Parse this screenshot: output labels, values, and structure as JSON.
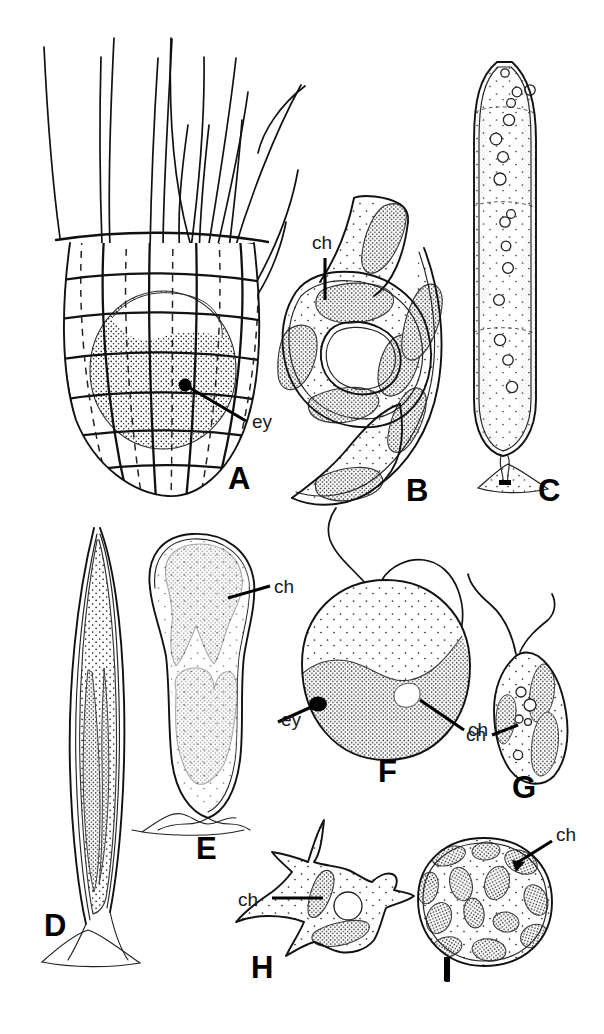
{
  "figure": {
    "background_color": "#ffffff",
    "ink_color": "#111111",
    "width": 604,
    "height": 1034,
    "panel_count": 9
  },
  "legend_keys": [
    {
      "abbr": "ch",
      "meaning": "chloroplast"
    },
    {
      "abbr": "ey",
      "meaning": "eyespot"
    }
  ],
  "panels": [
    {
      "id": "A",
      "letter": "A",
      "letter_x": 228,
      "letter_y": 489,
      "description": "Loricate flagellate with latticed gridded lorica, dashed internal ribs, dense stippled protoplast and a tuft of long bristles",
      "labels": [
        {
          "abbr": "ey",
          "text": "ey",
          "x": 252,
          "y": 428
        }
      ]
    },
    {
      "id": "B",
      "letter": "B",
      "letter_x": 406,
      "letter_y": 501,
      "description": "Spirally coiled ribbon-shaped cell with discoid chloroplasts and fine stippling",
      "labels": [
        {
          "abbr": "ch",
          "text": "ch",
          "x": 318,
          "y": 249
        }
      ]
    },
    {
      "id": "C",
      "letter": "C",
      "letter_x": 538,
      "letter_y": 501,
      "description": "Elongate club-shaped stalked cell attached to substrate, with parietal chloroplasts and a row of round vacuoles",
      "labels": []
    },
    {
      "id": "D",
      "letter": "D",
      "letter_x": 44,
      "letter_y": 936,
      "description": "Very elongate fusiform stalked cell with two lateral band chloroplasts and stippled cytoplasm",
      "labels": []
    },
    {
      "id": "E",
      "letter": "E",
      "letter_x": 196,
      "letter_y": 859,
      "description": "Club-shaped stalked cell with two lobed stippled chloroplasts",
      "labels": [
        {
          "abbr": "ch",
          "text": "ch",
          "x": 274,
          "y": 593
        }
      ]
    },
    {
      "id": "F",
      "letter": "F",
      "letter_x": 378,
      "letter_y": 782,
      "description": "Large spherical biflagellate cell with a single curved parietal chloroplast and a prominent eyespot",
      "labels": [
        {
          "abbr": "ey",
          "text": "ey",
          "x": 281,
          "y": 726
        },
        {
          "abbr": "ch",
          "text": "ch",
          "x": 475,
          "y": 736
        }
      ]
    },
    {
      "id": "G",
      "letter": "G",
      "letter_x": 512,
      "letter_y": 798,
      "description": "Small irregular biflagellate cell with several elongate chloroplasts and small vacuoles",
      "labels": [
        {
          "abbr": "ch",
          "text": "ch",
          "x": 474,
          "y": 737
        }
      ]
    },
    {
      "id": "H",
      "letter": "H",
      "letter_x": 251,
      "letter_y": 978,
      "description": "Amoeboid cell with radiating pseudopodia, two elongate chloroplasts and a central vacuole",
      "labels": [
        {
          "abbr": "ch",
          "text": "ch",
          "x": 243,
          "y": 906
        }
      ]
    },
    {
      "id": "I",
      "letter": "I",
      "letter_x": 468,
      "letter_y": 978,
      "description": "Spherical walled cell packed with numerous ovoid discoid chloroplasts",
      "labels": [
        {
          "abbr": "ch",
          "text": "ch",
          "x": 559,
          "y": 859
        }
      ]
    }
  ]
}
